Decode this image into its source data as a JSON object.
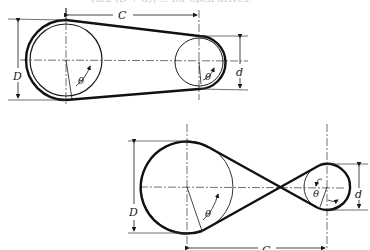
{
  "figure": {
    "caption_fragment": "= [π/2 (D + d)] ... for open drives.",
    "open_drive": {
      "center_distance_label": "C",
      "large_diameter_label": "D",
      "small_diameter_label": "d",
      "large_angle_label": "θ",
      "small_angle_label": "θ"
    },
    "crossed_drive": {
      "center_distance_label": "C",
      "large_diameter_label": "D",
      "small_diameter_label": "d",
      "large_angle_label": "θ",
      "small_angle_label": "θ"
    }
  },
  "colors": {
    "line": "#1a1a1a",
    "thin": "#333333",
    "background": "#ffffff"
  }
}
